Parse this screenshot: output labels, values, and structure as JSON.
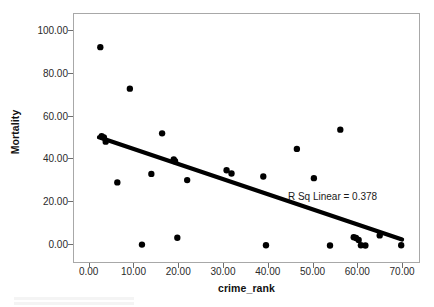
{
  "chart_data": {
    "type": "scatter",
    "title": "",
    "xlabel": "crime_rank",
    "ylabel": "Mortality",
    "xlim": [
      -3.5,
      74.0
    ],
    "ylim": [
      -9.0,
      108.0
    ],
    "xticks": [
      "0.00",
      "10.00",
      "20.00",
      "30.00",
      "40.00",
      "50.00",
      "60.00",
      "70.00"
    ],
    "xtick_values": [
      0,
      10,
      20,
      30,
      40,
      50,
      60,
      70
    ],
    "yticks": [
      "0.00",
      "20.00",
      "40.00",
      "60.00",
      "80.00",
      "100.00"
    ],
    "ytick_values": [
      0,
      20,
      40,
      60,
      80,
      100
    ],
    "grid": false,
    "legend": "none",
    "marker_color": "#000000",
    "marker_size": 4.6,
    "points": [
      {
        "x": 2.6,
        "y": 92.0
      },
      {
        "x": 9.2,
        "y": 72.6
      },
      {
        "x": 2.9,
        "y": 50.3
      },
      {
        "x": 3.4,
        "y": 49.8
      },
      {
        "x": 3.8,
        "y": 47.8
      },
      {
        "x": 16.4,
        "y": 51.7
      },
      {
        "x": 19.0,
        "y": 39.5
      },
      {
        "x": 19.3,
        "y": 38.6
      },
      {
        "x": 14.0,
        "y": 32.7
      },
      {
        "x": 6.4,
        "y": 28.7
      },
      {
        "x": 22.0,
        "y": 29.8
      },
      {
        "x": 30.8,
        "y": 34.4
      },
      {
        "x": 31.9,
        "y": 32.9
      },
      {
        "x": 39.0,
        "y": 31.5
      },
      {
        "x": 46.5,
        "y": 44.4
      },
      {
        "x": 50.3,
        "y": 30.7
      },
      {
        "x": 56.2,
        "y": 53.4
      },
      {
        "x": 11.9,
        "y": -0.4
      },
      {
        "x": 19.8,
        "y": 2.8
      },
      {
        "x": 39.6,
        "y": -0.7
      },
      {
        "x": 53.9,
        "y": -0.8
      },
      {
        "x": 59.2,
        "y": 3.1
      },
      {
        "x": 59.7,
        "y": 2.7
      },
      {
        "x": 60.3,
        "y": 1.8
      },
      {
        "x": 60.8,
        "y": -0.7
      },
      {
        "x": 61.8,
        "y": -0.8
      },
      {
        "x": 65.0,
        "y": 3.9
      },
      {
        "x": 69.8,
        "y": -0.7
      }
    ],
    "fit_line": {
      "label": "linear fit",
      "x_start": 2.3,
      "y_start": 49.8,
      "x_end": 70.0,
      "y_end": 2.0,
      "color": "#000000",
      "width": 4.2
    },
    "annotation": "R Sq Linear = 0.378",
    "r_squared": 0.378
  },
  "axes": {
    "y_title": "Mortality",
    "x_title": "crime_rank"
  }
}
